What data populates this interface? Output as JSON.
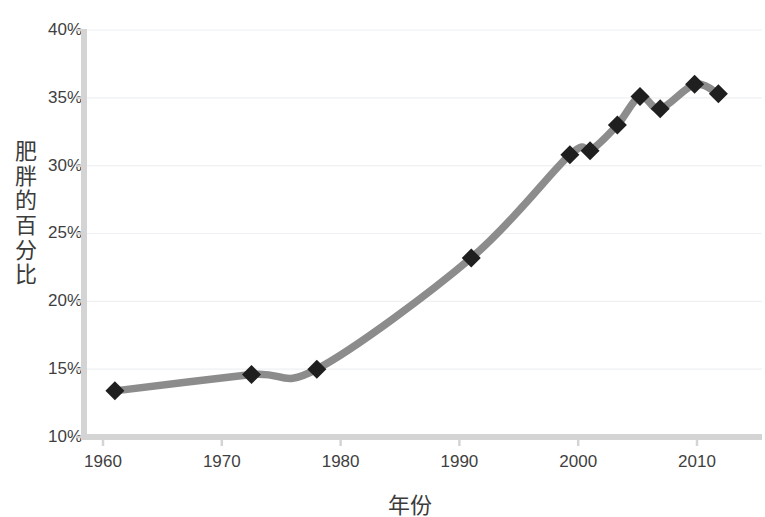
{
  "chart_data": {
    "type": "line",
    "title": "",
    "xlabel": "年份",
    "ylabel": "肥胖的百分比",
    "xlim": [
      1958,
      2015
    ],
    "ylim": [
      10,
      40
    ],
    "grid": true,
    "grid_axis": "y",
    "legend": false,
    "legend_position": "none",
    "y_tick_labels": [
      "40%",
      "35%",
      "30%",
      "25%",
      "20%",
      "15%",
      "10%"
    ],
    "y_ticks": [
      40,
      35,
      30,
      25,
      20,
      15,
      10
    ],
    "x_tick_labels": [
      "1960",
      "1970",
      "1980",
      "1990",
      "2000",
      "2010"
    ],
    "x_ticks": [
      1960,
      1970,
      1980,
      1990,
      2000,
      2010
    ],
    "series": [
      {
        "name": "肥胖的百分比",
        "line_color": "#8c8c8c",
        "marker_color": "#1f1f1f",
        "marker": "diamond",
        "x": [
          1961,
          1972.5,
          1978,
          1991,
          1999.3,
          2001,
          2003.3,
          2005.2,
          2006.9,
          2009.8,
          2011.8
        ],
        "values": [
          13.4,
          14.6,
          15.0,
          23.2,
          30.8,
          31.1,
          33.0,
          35.1,
          34.2,
          36.0,
          35.3
        ]
      }
    ],
    "colors": {
      "line": "#8c8c8c",
      "marker": "#1f1f1f",
      "axis": "#d4d4d4",
      "gridline": "#eef0f3",
      "text": "#3f3f3f",
      "background": "#ffffff"
    }
  },
  "axes": {
    "y_title": "肥胖的百分比",
    "x_title": "年份"
  }
}
